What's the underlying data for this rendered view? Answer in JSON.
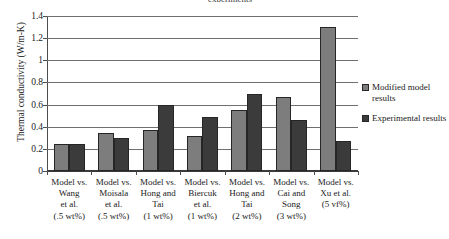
{
  "chart_data": {
    "type": "bar",
    "title": "experiments",
    "xlabel": "",
    "ylabel": "Thermal conductivity (W/m-K)",
    "ylim": [
      0,
      1.4
    ],
    "ytick_labels": [
      "0",
      "0.2",
      "0.4",
      "0.6",
      "0.8",
      "1",
      "1.2",
      "1.4"
    ],
    "ytick_values": [
      0,
      0.2,
      0.4,
      0.6,
      0.8,
      1,
      1.2,
      1.4
    ],
    "grid": true,
    "legend_position": "right",
    "categories": [
      "Model vs. Wang et al. (.5 wt%)",
      "Model vs. Moisala et al. (.5 wt%)",
      "Model vs. Hong and Tai (1 wt%)",
      "Model vs. Biercuk et al. (1 wt%)",
      "Model vs. Hong and Tai (2 wt%)",
      "Model vs. Cai and Song (3 wt%)",
      "Model vs. Xu et al. (5 vf%)"
    ],
    "category_lines": [
      [
        "Model vs.",
        "Wang",
        "et al.",
        "(.5 wt%)"
      ],
      [
        "Model vs.",
        "Moisala",
        "et al.",
        "(.5 wt%)"
      ],
      [
        "Model vs.",
        "Hong and",
        "Tai",
        "(1 wt%)"
      ],
      [
        "Model vs.",
        "Biercuk",
        "et al.",
        "(1 wt%)"
      ],
      [
        "Model vs.",
        "Hong and",
        "Tai",
        "(2 wt%)"
      ],
      [
        "Model vs.",
        "Cai and",
        "Song",
        "(3 wt%)"
      ],
      [
        "Model vs.",
        "Xu et al.",
        "(5 vf%)"
      ]
    ],
    "series": [
      {
        "name": "Modified model results",
        "color": "#7d7d7d",
        "values": [
          0.245,
          0.34,
          0.37,
          0.315,
          0.55,
          0.67,
          1.3
        ]
      },
      {
        "name": "Experimental results",
        "color": "#3b3b3b",
        "values": [
          0.245,
          0.295,
          0.595,
          0.49,
          0.7,
          0.46,
          0.27
        ]
      }
    ]
  },
  "legend": {
    "items": [
      {
        "label_line1": "Modified model",
        "label_line2": "results"
      },
      {
        "label_line1": "Experimental",
        "label_line2": "results"
      }
    ]
  }
}
